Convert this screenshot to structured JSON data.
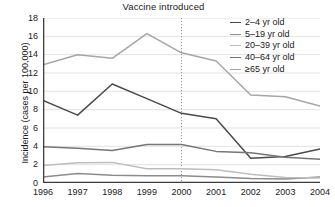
{
  "chart_data": {
    "type": "line",
    "title": "Vaccine introduced",
    "xlabel": "",
    "ylabel": "Incidence (cases per 100,000)",
    "x": [
      1996,
      1997,
      1998,
      1999,
      2000,
      2001,
      2002,
      2003,
      2004
    ],
    "xlim": [
      1996,
      2004
    ],
    "ylim": [
      0,
      18
    ],
    "y_ticks": [
      0,
      2,
      4,
      6,
      8,
      10,
      12,
      14,
      16,
      18
    ],
    "x_ticks": [
      "1996",
      "1997",
      "1998",
      "1999",
      "2000",
      "2001",
      "2002",
      "2003",
      "2004"
    ],
    "grid": "horizontal",
    "legend_position": "top-right",
    "annotations": [
      {
        "name": "vaccine-introduced-marker",
        "label": "Vaccine introduced",
        "x": 2000,
        "style": "vertical dotted line"
      }
    ],
    "series": [
      {
        "name": "2–4 yr old",
        "color": "#4a4a4a",
        "values": [
          9.0,
          7.4,
          10.8,
          9.2,
          7.6,
          7.0,
          2.7,
          2.9,
          3.7
        ]
      },
      {
        "name": "5–19 yr old",
        "color": "#8c8c8c",
        "values": [
          0.65,
          1.05,
          0.85,
          0.8,
          0.8,
          0.65,
          0.5,
          0.45,
          0.65
        ]
      },
      {
        "name": "20–39 yr old",
        "color": "#bdbdbd",
        "values": [
          1.9,
          2.2,
          2.25,
          1.55,
          1.55,
          1.45,
          0.95,
          0.6,
          0.55
        ]
      },
      {
        "name": "40–64 yr old",
        "color": "#767676",
        "values": [
          3.95,
          3.8,
          3.55,
          4.2,
          4.2,
          3.45,
          3.3,
          2.8,
          2.6
        ]
      },
      {
        "name": "≥65 yr old",
        "color": "#a6a6a6",
        "values": [
          12.9,
          14.0,
          13.6,
          16.3,
          14.2,
          13.3,
          9.6,
          9.4,
          8.4
        ]
      }
    ]
  },
  "colors": {
    "axis": "#3c3c3c",
    "grid": "#e2e2e2",
    "text": "#1a1a1a",
    "background": "#ffffff",
    "marker_line": "#9a9a9a"
  }
}
